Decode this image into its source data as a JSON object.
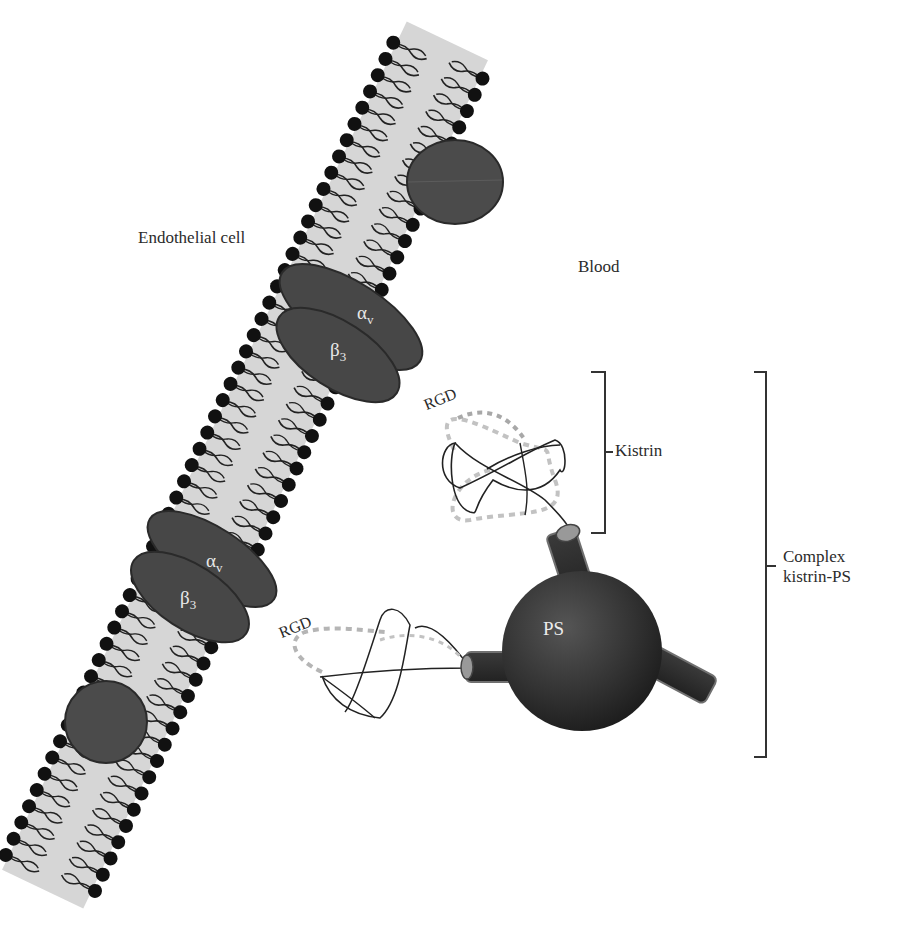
{
  "figure": {
    "regions": {
      "left_label": "Endothelial cell",
      "right_label": "Blood"
    },
    "membrane": {
      "type": "lipid bilayer",
      "head_color": "#111111",
      "core_color": "#d4d4d4",
      "protein_color": "#4d4d4d"
    },
    "integrins": [
      {
        "alpha": "α",
        "alpha_sub": "v",
        "beta": "β",
        "beta_sub": "3"
      },
      {
        "alpha": "α",
        "alpha_sub": "v",
        "beta": "β",
        "beta_sub": "3"
      }
    ],
    "peptides": [
      {
        "motif_label": "RGD"
      },
      {
        "motif_label": "RGD"
      }
    ],
    "nanoparticle": {
      "label": "PS",
      "color": "#2e2e2e"
    },
    "brackets": {
      "kistrin": "Kistrin",
      "complex_line1": "Complex",
      "complex_line2": "kistrin-PS"
    }
  }
}
